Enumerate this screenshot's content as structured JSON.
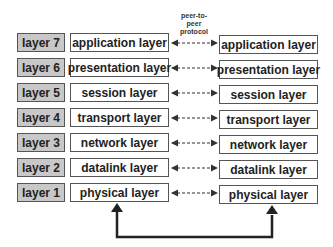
{
  "protocol_label": [
    "peer-to-",
    "peer",
    "protocol"
  ],
  "layers": [
    {
      "num": "layer 7",
      "left": "application layer",
      "right": "application layer"
    },
    {
      "num": "layer 6",
      "left": "presentation layer",
      "right": "presentation layer"
    },
    {
      "num": "layer 5",
      "left": "session layer",
      "right": "session layer"
    },
    {
      "num": "layer 4",
      "left": "transport layer",
      "right": "transport layer"
    },
    {
      "num": "layer 3",
      "left": "network layer",
      "right": "network layer"
    },
    {
      "num": "layer 2",
      "left": "datalink layer",
      "right": "datalink layer"
    },
    {
      "num": "layer 1",
      "left": "physical layer",
      "right": "physical layer"
    }
  ]
}
